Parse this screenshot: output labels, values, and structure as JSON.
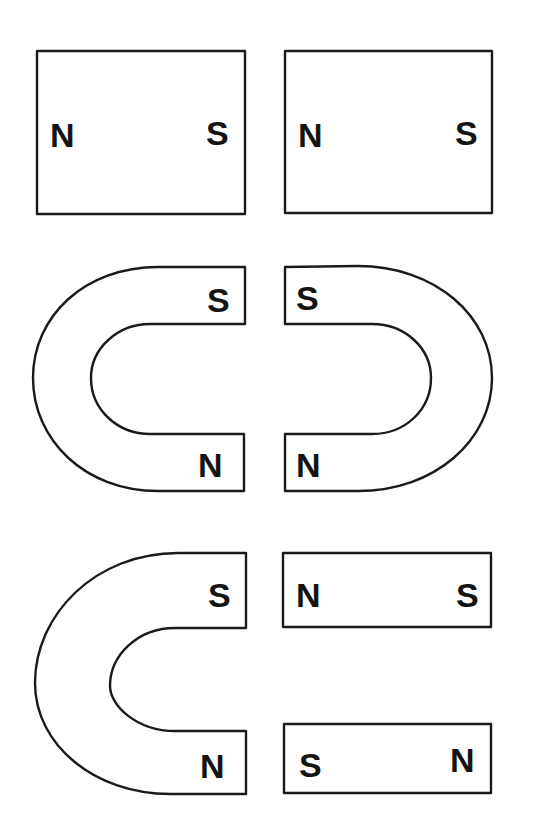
{
  "diagram": {
    "type": "magnet-pole-arrangements",
    "rows": [
      {
        "id": "row1",
        "description": "Two bar magnets side by side",
        "magnets": [
          {
            "kind": "bar",
            "left_label": "N",
            "right_label": "S"
          },
          {
            "kind": "bar",
            "left_label": "N",
            "right_label": "S"
          }
        ]
      },
      {
        "id": "row2",
        "description": "Two horseshoe magnets facing each other",
        "magnets": [
          {
            "kind": "horseshoe",
            "opening": "right",
            "top_label": "S",
            "bottom_label": "N"
          },
          {
            "kind": "horseshoe",
            "opening": "left",
            "top_label": "S",
            "bottom_label": "N"
          }
        ]
      },
      {
        "id": "row3",
        "description": "Horseshoe magnet facing two bar magnets",
        "magnets": [
          {
            "kind": "horseshoe",
            "opening": "right",
            "top_label": "S",
            "bottom_label": "N"
          },
          {
            "kind": "bar",
            "left_label": "N",
            "right_label": "S"
          },
          {
            "kind": "bar",
            "left_label": "S",
            "right_label": "N"
          }
        ]
      }
    ],
    "colors": {
      "stroke": "#1a1a1a",
      "fill": "#ffffff",
      "text": "#141414"
    }
  },
  "labels": {
    "r1m1_left": "N",
    "r1m1_right": "S",
    "r1m2_left": "N",
    "r1m2_right": "S",
    "r2m1_top": "S",
    "r2m1_bottom": "N",
    "r2m2_top": "S",
    "r2m2_bottom": "N",
    "r3m1_top": "S",
    "r3m1_bottom": "N",
    "r3m2_left": "N",
    "r3m2_right": "S",
    "r3m3_left": "S",
    "r3m3_right": "N"
  }
}
